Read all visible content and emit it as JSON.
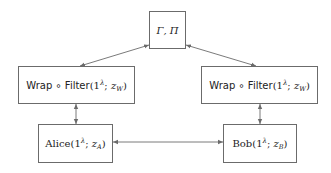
{
  "diagram": {
    "nodes": {
      "top": {
        "label": "Γ, Π"
      },
      "wrap_left": {
        "prefix": "Wrap ∘ Filter",
        "arg": "(1",
        "sup": "λ",
        "sep": "; ",
        "var": "z",
        "sub": "W",
        "close": ")"
      },
      "wrap_right": {
        "prefix": "Wrap ∘ Filter",
        "arg": "(1",
        "sup": "λ",
        "sep": "; ",
        "var": "z",
        "sub": "W",
        "close": ")"
      },
      "alice": {
        "name": "Alice",
        "arg": "(1",
        "sup": "λ",
        "sep": "; ",
        "var": "z",
        "sub": "A",
        "close": ")"
      },
      "bob": {
        "name": "Bob",
        "arg": "(1",
        "sup": "λ",
        "sep": "; ",
        "var": "z",
        "sub": "B",
        "close": ")"
      }
    },
    "edges": [
      {
        "from": "top",
        "to": "wrap_left",
        "type": "bidirectional"
      },
      {
        "from": "top",
        "to": "wrap_right",
        "type": "bidirectional"
      },
      {
        "from": "wrap_left",
        "to": "alice",
        "type": "bidirectional"
      },
      {
        "from": "wrap_right",
        "to": "bob",
        "type": "bidirectional"
      },
      {
        "from": "alice",
        "to": "bob",
        "type": "bidirectional"
      }
    ],
    "colors": {
      "stroke": "#6b6b6b",
      "text": "#222222",
      "background": "#ffffff"
    }
  }
}
